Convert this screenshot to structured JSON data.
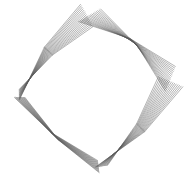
{
  "image": {
    "description": "String-art ring of twisted grey lines forming a rotated rounded square",
    "background_color": "#ffffff",
    "stroke_color": "#5a5a5a",
    "width": 187,
    "height": 180,
    "center": [
      93,
      90
    ],
    "lines_per_band": 16
  }
}
